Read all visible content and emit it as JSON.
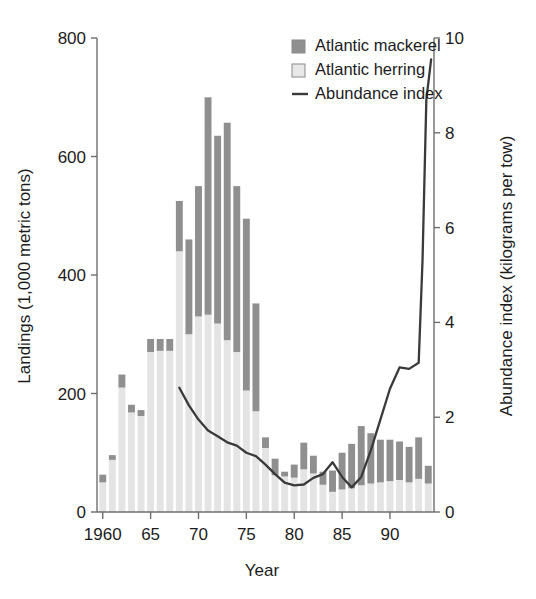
{
  "chart_data": {
    "type": "bar",
    "title": "",
    "subtitle": "",
    "xlabel": "Year",
    "ylabel": "Landings (1,000 metric tons)",
    "y2label": "Abundance index (kilograms per tow)",
    "grid": false,
    "legend_position": "top-right",
    "xlim": [
      1959.4,
      1994.6
    ],
    "ylim": [
      0,
      800
    ],
    "y2lim": [
      0,
      10
    ],
    "x_tick_labels": [
      "1960",
      "65",
      "70",
      "75",
      "80",
      "85",
      "90"
    ],
    "x_tick_values": [
      1960,
      1965,
      1970,
      1975,
      1980,
      1985,
      1990
    ],
    "y_tick_labels": [
      "0",
      "200",
      "400",
      "600",
      "800"
    ],
    "y_tick_values": [
      0,
      200,
      400,
      600,
      800
    ],
    "y2_tick_labels": [
      "0",
      "2",
      "4",
      "6",
      "8",
      "10"
    ],
    "y2_tick_values": [
      0,
      2,
      4,
      6,
      8,
      10
    ],
    "categories": [
      1960,
      1961,
      1962,
      1963,
      1964,
      1965,
      1966,
      1967,
      1968,
      1969,
      1970,
      1971,
      1972,
      1973,
      1974,
      1975,
      1976,
      1977,
      1978,
      1979,
      1980,
      1981,
      1982,
      1983,
      1984,
      1985,
      1986,
      1987,
      1988,
      1989,
      1990,
      1991,
      1992,
      1993,
      1994
    ],
    "series": [
      {
        "name": "Atlantic herring",
        "color": "#e4e4e4",
        "stack_order": 0,
        "values": [
          50,
          88,
          210,
          168,
          162,
          270,
          272,
          272,
          440,
          300,
          330,
          333,
          318,
          290,
          270,
          205,
          170,
          108,
          62,
          60,
          58,
          72,
          65,
          46,
          34,
          38,
          40,
          45,
          48,
          50,
          52,
          54,
          50,
          56,
          48
        ]
      },
      {
        "name": "Atlantic mackerel",
        "color": "#8f8f8f",
        "stack_order": 1,
        "values": [
          13,
          8,
          22,
          13,
          10,
          22,
          20,
          20,
          85,
          160,
          220,
          367,
          317,
          367,
          280,
          290,
          182,
          18,
          28,
          8,
          22,
          45,
          30,
          22,
          36,
          62,
          75,
          100,
          85,
          72,
          70,
          65,
          60,
          70,
          30
        ]
      }
    ],
    "totals": [
      63,
      96,
      232,
      181,
      172,
      292,
      292,
      292,
      525,
      460,
      550,
      700,
      635,
      657,
      550,
      495,
      352,
      126,
      90,
      68,
      80,
      117,
      95,
      68,
      70,
      100,
      115,
      145,
      133,
      122,
      122,
      119,
      110,
      126,
      78
    ],
    "line_series": {
      "name": "Abundance index",
      "color": "#3a3a3a",
      "axis": "right",
      "x": [
        1968,
        1969,
        1970,
        1971,
        1972,
        1973,
        1974,
        1975,
        1976,
        1977,
        1978,
        1979,
        1980,
        1981,
        1982,
        1983,
        1984,
        1985,
        1986,
        1987,
        1988,
        1989,
        1990,
        1991,
        1992,
        1993,
        1994
      ],
      "values": [
        2.62,
        2.25,
        1.95,
        1.72,
        1.6,
        1.47,
        1.4,
        1.25,
        1.18,
        1.0,
        0.8,
        0.62,
        0.56,
        0.58,
        0.72,
        0.8,
        1.05,
        0.74,
        0.52,
        0.74,
        1.3,
        1.95,
        2.6,
        3.05,
        3.02,
        3.15,
        9.6
      ],
      "note_tail": [
        [
          1991,
          3.05
        ],
        [
          1992,
          3.02
        ],
        [
          1993,
          3.15
        ],
        [
          1993.4,
          5.3
        ],
        [
          1993.8,
          8.7
        ],
        [
          1994.3,
          9.55
        ]
      ]
    }
  },
  "legend": {
    "items": [
      {
        "label": "Atlantic mackerel",
        "marker": "square-filled-dark",
        "color": "#8f8f8f"
      },
      {
        "label": "Atlantic herring",
        "marker": "square-filled-light",
        "color": "#e8e8e8"
      },
      {
        "label": "Abundance index",
        "marker": "line-dark",
        "color": "#3a3a3a"
      }
    ]
  }
}
